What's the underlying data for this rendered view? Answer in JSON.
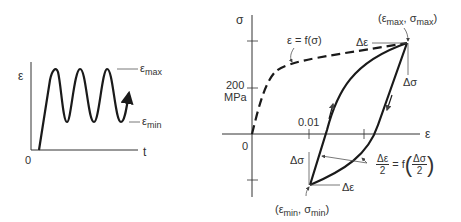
{
  "left_panel": {
    "y_axis_label": "ε",
    "x_axis_label": "t",
    "origin_label": "0",
    "max_label": "ε",
    "max_sub": "max",
    "min_label": "ε",
    "min_sub": "min",
    "curve_description": "cyclic strain vs time, oscillating between ε_max and ε_min"
  },
  "right_panel": {
    "y_axis_label": "σ",
    "x_axis_label": "ε",
    "origin_label": "0",
    "y_tick_label_value": "200",
    "y_tick_label_unit": "MPa",
    "x_tick_label": "0.01",
    "monotonic_curve_label": "ε = f(σ)",
    "max_point_label": "(ε max, σ max)",
    "max_point_parts": {
      "open": "(ε",
      "sub1": "max",
      "mid": ", σ",
      "sub2": "max",
      "close": ")"
    },
    "min_point_parts": {
      "open": "(ε",
      "sub1": "min",
      "mid": ", σ",
      "sub2": "min",
      "close": ")"
    },
    "delta_eps_top": "Δε",
    "delta_sigma_top": "Δσ",
    "delta_eps_bottom": "Δε",
    "delta_sigma_bottom": "Δσ",
    "hysteresis_relation": {
      "lhs_num": "Δε",
      "lhs_den": "2",
      "eq": "= f",
      "rhs_num": "Δσ",
      "rhs_den": "2"
    }
  },
  "colors": {
    "line": "#1a1a1a",
    "thin": "#444444",
    "text": "#333333"
  }
}
